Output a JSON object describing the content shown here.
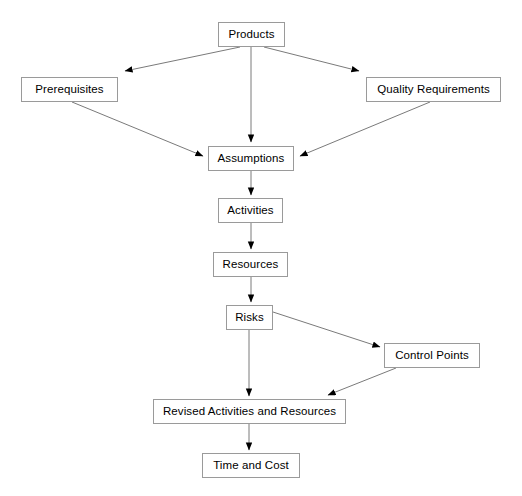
{
  "diagram": {
    "type": "flowchart",
    "background_color": "#ffffff",
    "node_border_color": "#9a9a9a",
    "node_fill_color": "#ffffff",
    "edge_color": "#7a7a7a",
    "arrowhead_color": "#000000",
    "text_color": "#000000",
    "nodes": [
      {
        "id": "products",
        "label": "Products",
        "x": 218,
        "y": 22,
        "w": 67,
        "h": 25
      },
      {
        "id": "prerequisites",
        "label": "Prerequisites",
        "x": 21,
        "y": 77,
        "w": 97,
        "h": 25
      },
      {
        "id": "quality",
        "label": "Quality Requirements",
        "x": 366,
        "y": 77,
        "w": 135,
        "h": 25
      },
      {
        "id": "assumptions",
        "label": "Assumptions",
        "x": 208,
        "y": 146,
        "w": 86,
        "h": 25
      },
      {
        "id": "activities",
        "label": "Activities",
        "x": 218,
        "y": 198,
        "w": 65,
        "h": 25
      },
      {
        "id": "resources",
        "label": "Resources",
        "x": 213,
        "y": 252,
        "w": 75,
        "h": 25
      },
      {
        "id": "risks",
        "label": "Risks",
        "x": 226,
        "y": 305,
        "w": 47,
        "h": 25
      },
      {
        "id": "control",
        "label": "Control Points",
        "x": 384,
        "y": 343,
        "w": 96,
        "h": 25
      },
      {
        "id": "revised",
        "label": "Revised Activities and Resources",
        "x": 153,
        "y": 399,
        "w": 193,
        "h": 25
      },
      {
        "id": "timecost",
        "label": "Time and Cost",
        "x": 202,
        "y": 453,
        "w": 98,
        "h": 25
      }
    ],
    "edges": [
      {
        "id": "products-prerequisites",
        "from": "products",
        "to": "prerequisites",
        "label": ""
      },
      {
        "id": "products-quality",
        "from": "products",
        "to": "quality",
        "label": ""
      },
      {
        "id": "products-assumptions",
        "from": "products",
        "to": "assumptions",
        "label": ""
      },
      {
        "id": "prerequisites-assumptions",
        "from": "prerequisites",
        "to": "assumptions",
        "label": ""
      },
      {
        "id": "quality-assumptions",
        "from": "quality",
        "to": "assumptions",
        "label": ""
      },
      {
        "id": "assumptions-activities",
        "from": "assumptions",
        "to": "activities",
        "label": ""
      },
      {
        "id": "activities-resources",
        "from": "activities",
        "to": "resources",
        "label": ""
      },
      {
        "id": "resources-risks",
        "from": "resources",
        "to": "risks",
        "label": ""
      },
      {
        "id": "risks-control",
        "from": "risks",
        "to": "control",
        "label": ""
      },
      {
        "id": "risks-revised",
        "from": "risks",
        "to": "revised",
        "label": ""
      },
      {
        "id": "control-revised",
        "from": "control",
        "to": "revised",
        "label": ""
      },
      {
        "id": "revised-timecost",
        "from": "revised",
        "to": "timecost",
        "label": ""
      }
    ]
  }
}
